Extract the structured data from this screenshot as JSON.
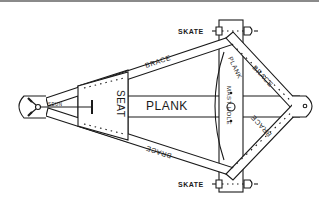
{
  "diagram": {
    "colors": {
      "ink": "#1a1a1a",
      "paper": "#ffffff",
      "top_rule": "#8a8a8a"
    },
    "labels": {
      "skate_top": "SKATE",
      "skate_bottom": "SKATE",
      "brace_upper_left": "BRACE",
      "brace_lower_left": "BRACE",
      "brace_upper_right": "BRACE",
      "brace_lower_right": "BRACE",
      "plank_main": "PLANK",
      "plank_cross": "PLANK",
      "seat": "SEAT",
      "mast_hole": "MAST HOLE",
      "tiller": "SEUN"
    },
    "parts": [
      "runner plank",
      "cross plank",
      "seat",
      "braces",
      "skates",
      "mast hole",
      "rudder / tiller",
      "bow plate"
    ]
  }
}
